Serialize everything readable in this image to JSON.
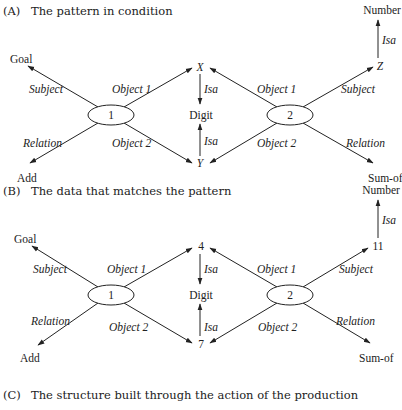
{
  "sections": [
    {
      "id": "A",
      "letter": "(A)",
      "caption": "The pattern in condition",
      "nodes": {
        "n1": "1",
        "n2": "2",
        "goal": "Goal",
        "add": "Add",
        "x": "X",
        "y": "Y",
        "digit": "Digit",
        "z": "Z",
        "number": "Number",
        "sumof": "Sum-of"
      },
      "edges": {
        "n1_goal": "Subject",
        "n1_x": "Object 1",
        "n1_add": "Relation",
        "n1_y": "Object 2",
        "x_digit": "Isa",
        "y_digit": "Isa",
        "n2_x": "Object 1",
        "n2_y": "Object 2",
        "n2_z": "Subject",
        "n2_sumof": "Relation",
        "z_number": "Isa"
      }
    },
    {
      "id": "B",
      "letter": "(B)",
      "caption": "The data that matches the pattern",
      "nodes": {
        "n1": "1",
        "n2": "2",
        "goal": "Goal",
        "add": "Add",
        "x": "4",
        "y": "7",
        "digit": "Digit",
        "z": "11",
        "number": "Number",
        "sumof": "Sum-of"
      },
      "edges": {
        "n1_goal": "Subject",
        "n1_x": "Object 1",
        "n1_add": "Relation",
        "n1_y": "Object 2",
        "x_digit": "Isa",
        "y_digit": "Isa",
        "n2_x": "Object 1",
        "n2_y": "Object 2",
        "n2_z": "Subject",
        "n2_sumof": "Relation",
        "z_number": "Isa"
      }
    },
    {
      "id": "C",
      "letter": "(C)",
      "caption": "The structure built through the action of the production"
    }
  ]
}
